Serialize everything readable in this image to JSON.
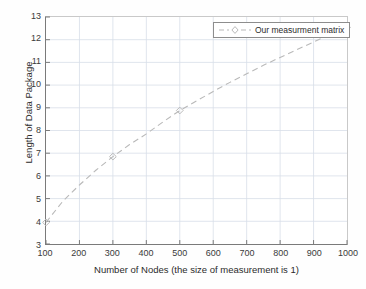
{
  "chart_data": {
    "type": "line",
    "title": "",
    "subtitle": "",
    "xlabel": "Number of Nodes (the size of measurement is 1)",
    "ylabel": "Length of Data Package",
    "xlim": [
      100,
      1000
    ],
    "ylim": [
      3,
      13
    ],
    "xticks": [
      100,
      200,
      300,
      400,
      500,
      600,
      700,
      800,
      900,
      1000
    ],
    "yticks": [
      3,
      4,
      5,
      6,
      7,
      8,
      9,
      10,
      11,
      12,
      13
    ],
    "grid": true,
    "legend_position": "top-right-inside",
    "series": [
      {
        "name": "Our measurment matrix",
        "color": "#b9b9b9",
        "linestyle": "dashed",
        "marker": "diamond",
        "x": [
          100,
          300,
          500,
          1000
        ],
        "y": [
          3.95,
          6.85,
          8.88,
          12.55
        ],
        "curve_x": [
          100,
          150,
          200,
          250,
          300,
          350,
          400,
          450,
          500,
          550,
          600,
          650,
          700,
          750,
          800,
          850,
          900,
          950,
          1000
        ],
        "curve_y": [
          3.95,
          4.88,
          5.6,
          6.26,
          6.85,
          7.38,
          7.85,
          8.38,
          8.88,
          9.3,
          9.72,
          10.12,
          10.5,
          10.87,
          11.22,
          11.56,
          11.9,
          12.23,
          12.55
        ]
      }
    ]
  },
  "legend": {
    "entries": [
      {
        "label": "Our measurment matrix",
        "marker": "diamond-marker-icon"
      }
    ]
  },
  "colors": {
    "series": "#b9b9b9",
    "grid": "#d8dee8",
    "axis": "#7a7a7a",
    "text": "#2b2b2b",
    "background": "#ffffff"
  }
}
